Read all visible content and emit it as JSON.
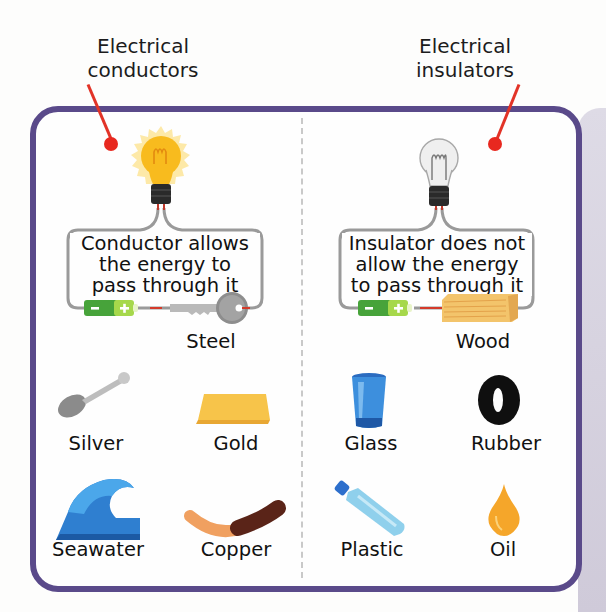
{
  "callouts": {
    "conductors": {
      "line1": "Electrical",
      "line2": "conductors"
    },
    "insulators": {
      "line1": "Electrical",
      "line2": "insulators"
    }
  },
  "conductor_circuit": {
    "bulb_state": "lit",
    "text_line1": "Conductor allows",
    "text_line2": "the energy to",
    "text_line3": "pass through it",
    "material_icon": "key-icon",
    "material_label": "Steel"
  },
  "insulator_circuit": {
    "bulb_state": "unlit",
    "text_line1": "Insulator does not",
    "text_line2": "allow the energy",
    "text_line3": "to pass through it",
    "material_icon": "wood-block-icon",
    "material_label": "Wood"
  },
  "battery": {
    "minus": "−",
    "plus": "+"
  },
  "conductors": [
    {
      "label": "Silver",
      "icon": "spoon-icon"
    },
    {
      "label": "Gold",
      "icon": "gold-bar-icon"
    },
    {
      "label": "Seawater",
      "icon": "wave-icon"
    },
    {
      "label": "Copper",
      "icon": "copper-wire-icon"
    }
  ],
  "insulators": [
    {
      "label": "Glass",
      "icon": "glass-cup-icon"
    },
    {
      "label": "Rubber",
      "icon": "tyre-icon"
    },
    {
      "label": "Plastic",
      "icon": "plastic-bottle-icon"
    },
    {
      "label": "Oil",
      "icon": "oil-drop-icon"
    }
  ],
  "colors": {
    "frame": "#5a4a8a",
    "callout_red": "#e8281f",
    "battery_green": "#4caf3a",
    "battery_light": "#a8d84a",
    "bulb_glow": "#f6b81c",
    "wire": "#9a9a9a"
  }
}
